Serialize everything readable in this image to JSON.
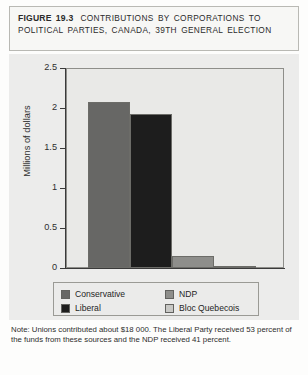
{
  "figure": {
    "number_label": "FIGURE 19.3",
    "title": "CONTRIBUTIONS BY CORPORATIONS TO POLITICAL PARTIES, CANADA, 39TH GENERAL ELECTION",
    "note": "Note: Unions contributed about $18 000. The Liberal Party received 53 percent of the funds from these sources and the NDP received 41 percent."
  },
  "chart_data": {
    "type": "bar",
    "title": "CONTRIBUTIONS BY CORPORATIONS TO POLITICAL PARTIES, CANADA, 39TH GENERAL ELECTION",
    "xlabel": "",
    "ylabel": "Millions of dollars",
    "ylim": [
      0,
      2.5
    ],
    "yticks": [
      "0",
      "0.5",
      "1",
      "1.5",
      "2",
      "2.5"
    ],
    "ytick_values": [
      0,
      0.5,
      1,
      1.5,
      2,
      2.5
    ],
    "grid": false,
    "legend_position": "bottom",
    "categories": [
      "Conservative",
      "Liberal",
      "NDP",
      "Bloc Quebecois"
    ],
    "values": [
      2.08,
      1.93,
      0.15,
      0.03
    ],
    "colors": [
      "#676765",
      "#1d1d1d",
      "#8e8e8b",
      "#c8c8c5"
    ]
  },
  "legend": {
    "entries": [
      {
        "label": "Conservative",
        "color": "#676765"
      },
      {
        "label": "NDP",
        "color": "#8e8e8b"
      },
      {
        "label": "Liberal",
        "color": "#1d1d1d"
      },
      {
        "label": "Bloc Quebecois",
        "color": "#c8c8c5"
      }
    ]
  }
}
